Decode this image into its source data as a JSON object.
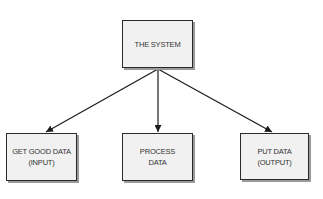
{
  "diagram": {
    "type": "hierarchy",
    "root": {
      "id": "system",
      "lines": [
        "THE SYSTEM"
      ]
    },
    "children": [
      {
        "id": "input",
        "lines": [
          "GET GOOD DATA",
          "(INPUT)"
        ]
      },
      {
        "id": "process",
        "lines": [
          "PROCESS",
          "DATA"
        ]
      },
      {
        "id": "output",
        "lines": [
          "PUT DATA",
          "(OUTPUT)"
        ]
      }
    ],
    "edges": [
      {
        "from": "system",
        "to": "input"
      },
      {
        "from": "system",
        "to": "process"
      },
      {
        "from": "system",
        "to": "output"
      }
    ],
    "colors": {
      "box_fill": "#f1f1f1",
      "box_border": "#2a2a2a",
      "box_shadow": "#9a9a9a",
      "arrow": "#1a1a1a",
      "text": "#333333"
    }
  }
}
